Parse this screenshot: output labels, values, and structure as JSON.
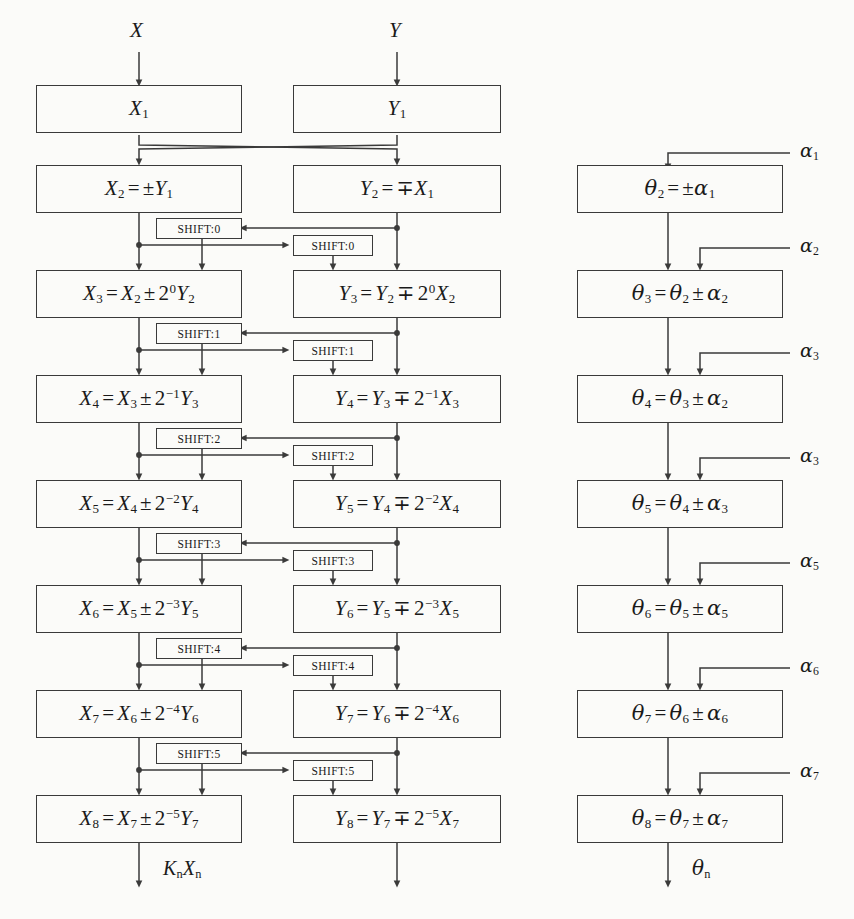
{
  "diagram": {
    "background_color": "#fbfbf9",
    "line_color": "#3a3a3a",
    "inputs": {
      "x_label": "X",
      "y_label": "Y"
    },
    "outputs": {
      "x_label": "KnXn",
      "theta_label": "θn"
    }
  },
  "x_column": {
    "name": "X datapath",
    "boxes": [
      {
        "id": "x1",
        "text": "X1"
      },
      {
        "id": "x2",
        "text": "X2 = ±Y1"
      },
      {
        "id": "x3",
        "text": "X3 = X2 ± 2^0 Y2"
      },
      {
        "id": "x4",
        "text": "X4 = X3 ± 2^-1 Y3"
      },
      {
        "id": "x5",
        "text": "X5 = X4 ± 2^-2 Y4"
      },
      {
        "id": "x6",
        "text": "X6 = X5 ± 2^-3 Y5"
      },
      {
        "id": "x7",
        "text": "X7 = X6 ± 2^-4 Y6"
      },
      {
        "id": "x8",
        "text": "X8 = X7 ± 2^-5 Y7"
      }
    ]
  },
  "y_column": {
    "name": "Y datapath",
    "boxes": [
      {
        "id": "y1",
        "text": "Y1"
      },
      {
        "id": "y2",
        "text": "Y2 = ∓X1"
      },
      {
        "id": "y3",
        "text": "Y3 = Y2 ∓ 2^0 X2"
      },
      {
        "id": "y4",
        "text": "Y4 = Y3 ∓ 2^-1 X3"
      },
      {
        "id": "y5",
        "text": "Y5 = Y4 ∓ 2^-2 X4"
      },
      {
        "id": "y6",
        "text": "Y6 = Y5 ∓ 2^-3 X5"
      },
      {
        "id": "y7",
        "text": "Y7 = Y6 ∓ 2^-4 X6"
      },
      {
        "id": "y8",
        "text": "Y8 = Y7 ∓ 2^-5 X7"
      }
    ]
  },
  "theta_column": {
    "name": "Angle accumulator datapath",
    "boxes": [
      {
        "id": "t2",
        "text": "θ2 = ±α1"
      },
      {
        "id": "t3",
        "text": "θ3 = θ2 ± α2"
      },
      {
        "id": "t4",
        "text": "θ4 = θ3 ± α2"
      },
      {
        "id": "t5",
        "text": "θ5 = θ4 ± α3"
      },
      {
        "id": "t6",
        "text": "θ6 = θ5 ± α5"
      },
      {
        "id": "t7",
        "text": "θ7 = θ6 ± α6"
      },
      {
        "id": "t8",
        "text": "θ8 = θ7 ± α7"
      }
    ],
    "alpha_inputs": [
      {
        "id": "a1",
        "text": "α1"
      },
      {
        "id": "a2",
        "text": "α2"
      },
      {
        "id": "a3",
        "text": "α3"
      },
      {
        "id": "a4",
        "text": "α3"
      },
      {
        "id": "a5",
        "text": "α5"
      },
      {
        "id": "a6",
        "text": "α6"
      },
      {
        "id": "a7",
        "text": "α7"
      }
    ]
  },
  "shift_stages": [
    {
      "stage": 0,
      "left_label": "SHIFT:0",
      "right_label": "SHIFT:0"
    },
    {
      "stage": 1,
      "left_label": "SHIFT:1",
      "right_label": "SHIFT:1"
    },
    {
      "stage": 2,
      "left_label": "SHIFT:2",
      "right_label": "SHIFT:2"
    },
    {
      "stage": 3,
      "left_label": "SHIFT:3",
      "right_label": "SHIFT:3"
    },
    {
      "stage": 4,
      "left_label": "SHIFT:4",
      "right_label": "SHIFT:4"
    },
    {
      "stage": 5,
      "left_label": "SHIFT:5",
      "right_label": "SHIFT:5"
    }
  ]
}
